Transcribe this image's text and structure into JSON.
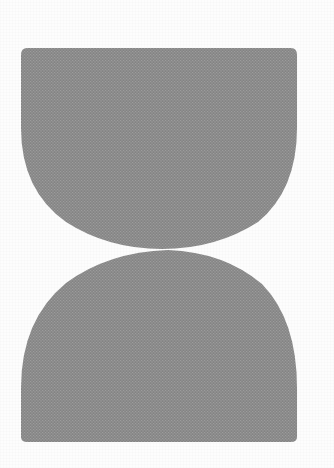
{
  "figure": {
    "background_color": "#fdfdfd",
    "canvas": {
      "width": 334,
      "height": 468
    }
  },
  "shapes": [
    {
      "id": "upper-bowl",
      "name": "Upper bowl shape",
      "fill_color": "#8a8a8a",
      "texture": "halftone-dot-grid",
      "top_edge_y": 48,
      "bottom_y": 249,
      "left_x": 21,
      "right_x": 297,
      "flat_edge": "top",
      "path": "M 27 48 L 291 48 Q 297 48 297 55 L 297 128 Q 297 190 258 222 Q 216 249 162 249 Q 108 249 66 222 Q 21 190 21 128 L 21 55 Q 21 48 27 48 Z"
    },
    {
      "id": "lower-dome",
      "name": "Lower dome shape",
      "fill_color": "#8a8a8a",
      "texture": "halftone-dot-grid",
      "top_y": 249,
      "bottom_edge_y": 442,
      "left_x": 21,
      "right_x": 297,
      "flat_edge": "bottom",
      "path": "M 21 437 L 21 388 Q 21 320 66 283 Q 108 252 168 250 Q 224 252 262 284 Q 297 320 297 388 L 297 437 Q 297 442 291 442 L 27 442 Q 21 442 21 437 Z"
    }
  ],
  "waist": {
    "name": "Waist contact point",
    "x": 166,
    "y": 248,
    "note": "Narrowest gap where the upper bowl and lower dome meet"
  },
  "palette": {
    "shape_gray": "#8a8a8a",
    "shape_gray_light": "#9a9a9a",
    "shape_gray_dark": "#7d7d7d",
    "background": "#fdfdfd",
    "edge_shadow": "rgba(0,0,0,0.10)"
  }
}
